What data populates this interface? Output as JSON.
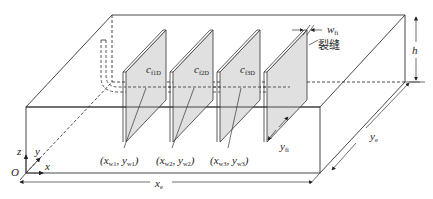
{
  "figure": {
    "type": "3D reservoir schematic with multi-stage fractured horizontal well",
    "colors": {
      "line": "#333333",
      "fracture_fill": "#e0e0e0",
      "background": "#ffffff"
    }
  },
  "labels": {
    "fractures": [
      {
        "base": "c",
        "sub": "f1D"
      },
      {
        "base": "c",
        "sub": "f2D"
      },
      {
        "base": "c",
        "sub": "f3D"
      }
    ],
    "fracture_width": {
      "base": "w",
      "sub": "fi"
    },
    "fracture_text": "裂缝",
    "fracture_halflength": {
      "base": "y",
      "sub": "fi"
    },
    "height": "h",
    "well_points": [
      {
        "x": "x",
        "xsub": "w1",
        "y": "y",
        "ysub": "w1"
      },
      {
        "x": "x",
        "xsub": "w2",
        "y": "y",
        "ysub": "w2"
      },
      {
        "x": "x",
        "xsub": "w3",
        "y": "y",
        "ysub": "w3"
      }
    ],
    "xe": {
      "base": "x",
      "sub": "e"
    },
    "ye": {
      "base": "y",
      "sub": "e"
    },
    "axes": {
      "x": "x",
      "y": "y",
      "z": "z",
      "origin": "O"
    }
  }
}
